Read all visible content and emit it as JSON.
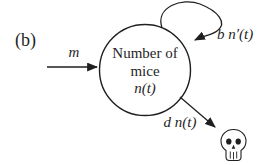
{
  "figure": {
    "panel_label": "(b)",
    "background_color": "#ffffff",
    "line_color": "#1f1f1f",
    "text_color": "#1f1f1f"
  },
  "node": {
    "line1": "Number of",
    "line2": "mice",
    "line3": "n(t)"
  },
  "flows": {
    "immigration_label": "m",
    "birth_loop_label": "b n′(t)",
    "death_label": "d n(t)"
  },
  "icons": {
    "death_icon": "skull"
  }
}
